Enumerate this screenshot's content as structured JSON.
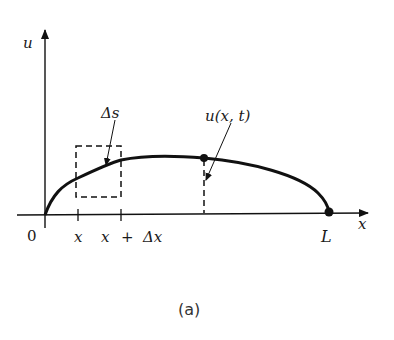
{
  "figure": {
    "caption": "(a)",
    "axes": {
      "y_label": "u",
      "x_label": "x",
      "origin_label": "0"
    },
    "ticks": {
      "x": "x",
      "x_plus_dx_x": "x",
      "x_plus_dx_plus": "+",
      "x_plus_dx_delta": "Δx",
      "end": "L"
    },
    "annotations": {
      "arc_length": "Δs",
      "displacement": "u(x, t)"
    },
    "colors": {
      "ink": "#111111",
      "background": "#ffffff"
    }
  }
}
